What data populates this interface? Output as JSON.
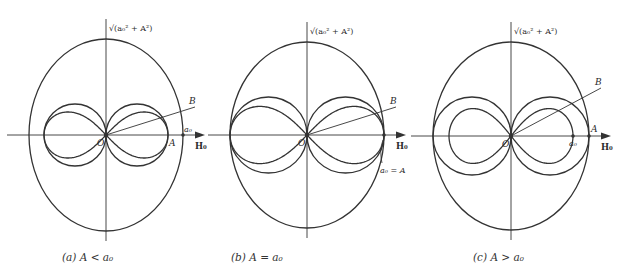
{
  "figure": {
    "stroke_color": "#333333",
    "panels": [
      {
        "id": "a",
        "caption": "(a)  A < a₀",
        "origin_label": "O",
        "top_label": "√(a₀² + A²)",
        "b_label": "B",
        "a_label": "A",
        "a0_label": "a₀",
        "axis_label": "H₀",
        "cx": 106,
        "cy": 135,
        "oval": {
          "rx": 77,
          "ry": 96
        },
        "circle_r": 31,
        "lemniscate_a": 62,
        "a_pos": 62,
        "a0_pos": 78,
        "condition": "A < a0"
      },
      {
        "id": "b",
        "caption": "(b)  A = a₀",
        "origin_label": "O",
        "top_label": "√(a₀² + A²)",
        "b_label": "B",
        "axis_label": "H₀",
        "equal_label": "a₀ = A",
        "cx": 307,
        "cy": 135,
        "oval": {
          "rx": 77,
          "ry": 93
        },
        "circle_r": 38,
        "lemniscate_a": 77,
        "a_pos": 77,
        "a0_pos": 77,
        "condition": "A = a0"
      },
      {
        "id": "c",
        "caption": "(c)  A > a₀",
        "origin_label": "O",
        "top_label": "√(a₀² + A²)",
        "b_label": "B",
        "a_label": "A",
        "a0_label": "a₀",
        "axis_label": "H₀",
        "cx": 511,
        "cy": 136,
        "oval": {
          "rx": 78,
          "ry": 94
        },
        "circle_r": 39,
        "lemniscate_a": 62,
        "a_pos": 78,
        "a0_pos": 62,
        "condition": "A > a0"
      }
    ]
  }
}
